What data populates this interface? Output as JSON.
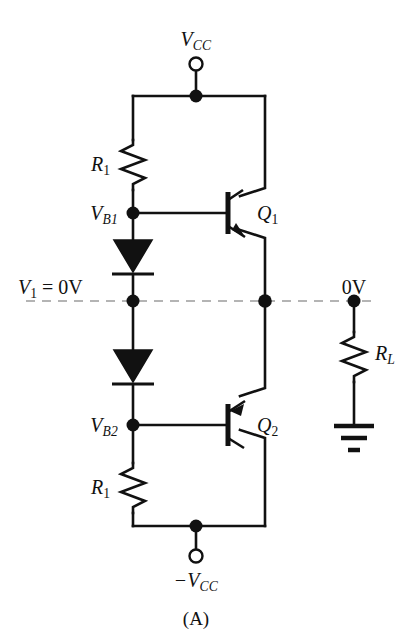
{
  "figure": {
    "caption": "(A)",
    "background_color": "#ffffff",
    "line_color": "#111111",
    "dashed_line_color": "#b4b4b4",
    "width": 412,
    "height": 642
  },
  "labels": {
    "vcc_top": {
      "base": "V",
      "sub": "CC",
      "text": "VCC"
    },
    "vcc_bottom": {
      "base": "−V",
      "sub": "CC",
      "text": "−VCC"
    },
    "r1_top": {
      "base": "R",
      "sub": "1",
      "text": "R1"
    },
    "r1_bottom": {
      "base": "R",
      "sub": "1",
      "text": "R1"
    },
    "rl": {
      "base": "R",
      "sub": "L",
      "text": "RL"
    },
    "vb1": {
      "base": "V",
      "sub": "B1",
      "text": "VB1"
    },
    "vb2": {
      "base": "V",
      "sub": "B2",
      "text": "VB2"
    },
    "q1": {
      "base": "Q",
      "sub": "1",
      "text": "Q1"
    },
    "q2": {
      "base": "Q",
      "sub": "2",
      "text": "Q2"
    },
    "v1_input": {
      "base": "V",
      "sub": "1",
      "suffix": " = 0V",
      "text": "V1 = 0V"
    },
    "output_zero_volts": {
      "text": "0V"
    }
  },
  "components": [
    {
      "id": "R1-top",
      "type": "resistor",
      "label": "R1",
      "orientation": "vertical"
    },
    {
      "id": "R1-bot",
      "type": "resistor",
      "label": "R1",
      "orientation": "vertical"
    },
    {
      "id": "RL",
      "type": "resistor",
      "label": "RL",
      "orientation": "vertical"
    },
    {
      "id": "D1",
      "type": "diode",
      "label": "",
      "orientation": "down"
    },
    {
      "id": "D2",
      "type": "diode",
      "label": "",
      "orientation": "down"
    },
    {
      "id": "Q1",
      "type": "transistor",
      "label": "Q1",
      "polarity": "NPN"
    },
    {
      "id": "Q2",
      "type": "transistor",
      "label": "Q2",
      "polarity": "PNP"
    },
    {
      "id": "GND",
      "type": "ground",
      "label": "",
      "bars": 3
    }
  ],
  "terminals": [
    {
      "id": "vcc-terminal",
      "label": "VCC",
      "style": "open-circle"
    },
    {
      "id": "-vcc-terminal",
      "label": "-VCC",
      "style": "open-circle"
    }
  ],
  "nodes": [
    {
      "id": "node-vcc-rail",
      "label": ""
    },
    {
      "id": "node-vb1",
      "label": "VB1"
    },
    {
      "id": "node-input",
      "label": "V1 = 0V"
    },
    {
      "id": "node-output",
      "label": ""
    },
    {
      "id": "node-load",
      "label": "0V"
    },
    {
      "id": "node-vb2",
      "label": "VB2"
    },
    {
      "id": "node-neg-rail",
      "label": ""
    }
  ]
}
